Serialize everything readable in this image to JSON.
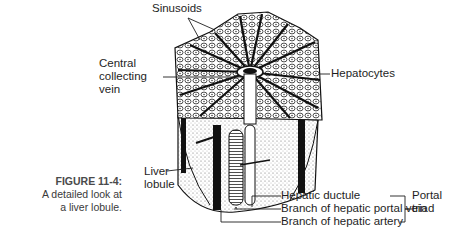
{
  "figure": {
    "number": "FIGURE 11-4:",
    "caption_line1": "A detailed look at",
    "caption_line2": "a liver lobule."
  },
  "labels": {
    "sinusoids": "Sinusoids",
    "central_vein_1": "Central",
    "central_vein_2": "collecting",
    "central_vein_3": "vein",
    "hepatocytes": "Hepatocytes",
    "liver_lobule_1": "Liver",
    "liver_lobule_2": "lobule",
    "hepatic_ductule": "Hepatic ductule",
    "portal_vein_branch": "Branch of hepatic portal vein",
    "hepatic_artery_branch": "Branch of hepatic artery",
    "portal_triad_1": "Portal",
    "portal_triad_2": "triad"
  },
  "colors": {
    "ink": "#1e1e1e",
    "background": "#ffffff",
    "caption": "#3a3a3a"
  }
}
